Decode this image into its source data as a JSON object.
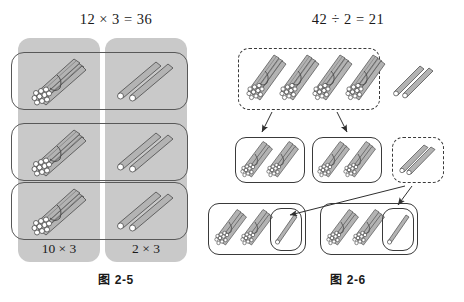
{
  "page": {
    "width": 464,
    "height": 302,
    "background": "#ffffff",
    "stick_fill": "#b3b3b3",
    "stick_stroke": "#4a4a4a",
    "tip_fill": "#ffffff",
    "panel_grey": "#c9c9c9",
    "outline_color": "#585858"
  },
  "left_figure": {
    "equation": "12 × 3 = 36",
    "caption": "图 2-5",
    "columns": [
      {
        "id": "tens",
        "label": "10 × 3",
        "item": "bundle-of-ten-sticks",
        "item_count_per_row": 1
      },
      {
        "id": "ones",
        "label": "2 × 3",
        "item": "two-loose-sticks",
        "item_count_per_row": 2
      }
    ],
    "rows": 3,
    "row_items": [
      {
        "tens": "bundle-of-ten",
        "ones": "two-sticks"
      },
      {
        "tens": "bundle-of-ten",
        "ones": "two-sticks"
      },
      {
        "tens": "bundle-of-ten",
        "ones": "two-sticks"
      }
    ]
  },
  "right_figure": {
    "equation": "42 ÷ 2 = 21",
    "caption": "图 2-6",
    "top_group": {
      "style": "dashed",
      "bundle_count": 4,
      "loose_sticks_outside": 2
    },
    "middle_groups": [
      {
        "style": "solid",
        "bundle_count": 2,
        "loose_sticks": 0
      },
      {
        "style": "solid",
        "bundle_count": 2,
        "loose_sticks": 0
      },
      {
        "style": "dashed",
        "bundle_count": 0,
        "loose_sticks": 2
      }
    ],
    "bottom_groups": [
      {
        "style": "solid",
        "bundle_count": 2,
        "inner_box_sticks": 1
      },
      {
        "style": "solid",
        "bundle_count": 2,
        "inner_box_sticks": 1
      }
    ],
    "arrows": [
      {
        "from": "top-group",
        "to": "middle-group-1"
      },
      {
        "from": "top-group",
        "to": "middle-group-2"
      },
      {
        "from": "loose-sticks-box",
        "to": "bottom-group-1-inner-box"
      },
      {
        "from": "loose-sticks-box",
        "to": "bottom-group-2-inner-box"
      }
    ]
  }
}
